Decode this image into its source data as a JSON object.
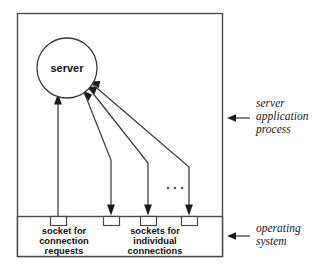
{
  "diagram": {
    "process_node": {
      "label": "server",
      "shape": "circle"
    },
    "sockets": [
      {
        "id": "socket-listen",
        "group": "connection-requests",
        "direction": "up-to-server"
      },
      {
        "id": "socket-conn-1",
        "group": "individual-connections",
        "direction": "down-to-socket"
      },
      {
        "id": "socket-conn-2",
        "group": "individual-connections",
        "direction": "down-to-socket"
      },
      {
        "id": "socket-conn-3",
        "group": "individual-connections",
        "direction": "down-to-socket"
      }
    ],
    "ellipsis": "...",
    "socket_labels": [
      {
        "id": "label-connection-requests",
        "lines": [
          "socket for",
          "connection",
          "requests"
        ]
      },
      {
        "id": "label-individual-connections",
        "lines": [
          "sockets for",
          "individual",
          "connections"
        ]
      }
    ],
    "annotations": [
      {
        "id": "annotation-server-process",
        "lines": [
          "server",
          "application",
          "process"
        ]
      },
      {
        "id": "annotation-operating-system",
        "lines": [
          "operating",
          "system"
        ]
      }
    ],
    "colors": {
      "stroke": "#3b3b3b",
      "box_stroke": "#4a4a4a",
      "arrow_fill": "#1a1a1a",
      "text": "#111111",
      "annotation_text": "#1a1a1a",
      "background": "#ffffff",
      "dot": "#5a5a5a"
    }
  }
}
